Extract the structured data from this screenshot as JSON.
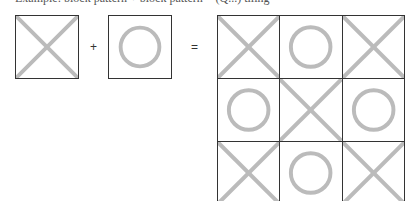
{
  "caption": "Example: block pattern + block pattern = (Q...) tiling",
  "operators": {
    "plus": "+",
    "equals": "="
  },
  "inputs": [
    {
      "symbol": "X"
    },
    {
      "symbol": "O"
    }
  ],
  "result_grid": {
    "rows": 3,
    "cols": 3,
    "cells": [
      "X",
      "O",
      "X",
      "O",
      "X",
      "O",
      "X",
      "O",
      "X"
    ]
  },
  "colors": {
    "stroke": "#bbbbbb",
    "border": "#333333"
  }
}
